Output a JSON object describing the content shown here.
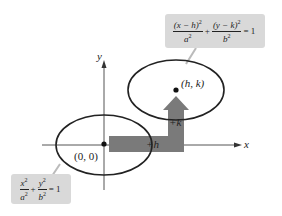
{
  "diagram": {
    "axes": {
      "x_label": "x",
      "y_label": "y"
    },
    "points": {
      "origin": "(0, 0)",
      "center": "(h, k)"
    },
    "arrow": {
      "horizontal_label": "+h",
      "vertical_label": "+k",
      "color": "#7a7a7a"
    },
    "equations": {
      "translated": {
        "term1_num": "(x − h)",
        "term1_den": "a",
        "term2_num": "(y − k)",
        "term2_den": "b",
        "plus": "+",
        "equals": "= 1",
        "exp": "2"
      },
      "standard": {
        "term1_num": "x",
        "term1_den": "a",
        "term2_num": "y",
        "term2_den": "b",
        "plus": "+",
        "equals": "= 1",
        "exp": "2"
      }
    },
    "colors": {
      "ellipse": "#222222",
      "box": "#d9d9d9",
      "arrow": "#7a7a7a"
    }
  }
}
